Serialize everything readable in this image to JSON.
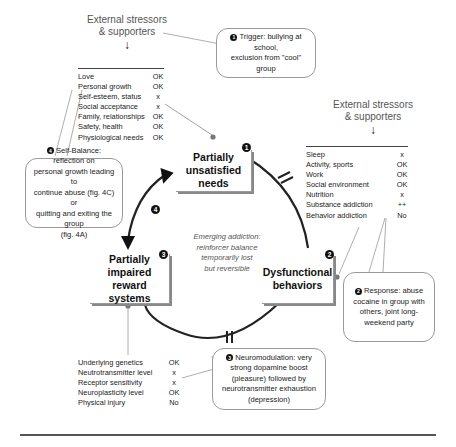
{
  "stressors_top_left": {
    "title_line1": "External stressors",
    "title_line2": "& supporters",
    "arrow": "down-arrow-icon",
    "rows": [
      {
        "label": "Love",
        "value": "OK"
      },
      {
        "label": "Personal growth",
        "value": "OK"
      },
      {
        "label": "Self-esteem, status",
        "value": "x"
      },
      {
        "label": "Social acceptance",
        "value": "x"
      },
      {
        "label": "Family, relationships",
        "value": "OK"
      },
      {
        "label": "Safety, health",
        "value": "OK"
      },
      {
        "label": "Physiological needs",
        "value": "OK"
      }
    ]
  },
  "stressors_right": {
    "title_line1": "External stressors",
    "title_line2": "& supporters",
    "arrow": "down-arrow-icon",
    "rows": [
      {
        "label": "Sleep",
        "value": "x"
      },
      {
        "label": "Activity, sports",
        "value": "OK"
      },
      {
        "label": "Work",
        "value": "OK"
      },
      {
        "label": "Social environment",
        "value": "OK"
      },
      {
        "label": "Nutrition",
        "value": "x"
      },
      {
        "label": "Substance addiction",
        "value": "++"
      },
      {
        "label": "Behavior addiction",
        "value": "No"
      }
    ]
  },
  "reward_factors": {
    "rows": [
      {
        "label": "Underlying genetics",
        "value": "OK"
      },
      {
        "label": "Neutrotransmitter level",
        "value": "x"
      },
      {
        "label": "Receptor sensitivity",
        "value": "x"
      },
      {
        "label": "Neuroplasticity level",
        "value": "OK"
      },
      {
        "label": "Physical injury",
        "value": "No"
      }
    ]
  },
  "nodes": {
    "needs": {
      "badge": "1",
      "line1": "Partially",
      "line2": "unsatisfied needs"
    },
    "behaviors": {
      "badge": "2",
      "line1": "Dysfunctional",
      "line2": "behaviors"
    },
    "reward": {
      "badge": "3",
      "line1": "Partially impaired",
      "line2": "reward systems"
    },
    "loop_badge": "4"
  },
  "callouts": {
    "trigger": {
      "badge": "1",
      "text_line1": "Trigger: bullying at school,",
      "text_line2": "exclusion from \"cool\" group"
    },
    "response": {
      "badge": "2",
      "text_line1": "Response: abuse",
      "text_line2": "cocaine in group with",
      "text_line3": "others, joint long-",
      "text_line4": "weekend party"
    },
    "neuromodulation": {
      "badge": "3",
      "text_line1": "Neuromodulation: very",
      "text_line2": "strong dopamine boost",
      "text_line3": "(pleasure) followed by",
      "text_line4": "neurotransmitter exhaustion",
      "text_line5": "(depression)"
    },
    "self_balance": {
      "badge": "4",
      "text_line1": "Self-Balance: reflection on",
      "text_line2": "personal growth leading to",
      "text_line3": "continue abuse (fig. 4C) or",
      "text_line4": "quitting and exiting the group",
      "text_line5": "(fig. 4A)"
    }
  },
  "center_note": {
    "line1": "Emerging addiction:",
    "line2": "reinforcer balance",
    "line3": "temporarily lost",
    "line4": "but reversible"
  }
}
